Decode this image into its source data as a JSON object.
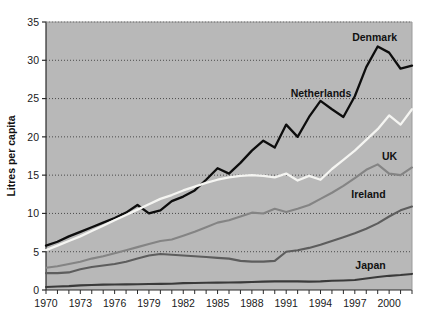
{
  "chart_data": {
    "type": "line",
    "title": "",
    "xlabel": "",
    "ylabel": "Litres per capita",
    "xlim": [
      1970,
      2002
    ],
    "ylim": [
      0,
      35
    ],
    "ytick_step": 5,
    "yticks": [
      0,
      5,
      10,
      15,
      20,
      25,
      30,
      35
    ],
    "ytick_labels": [
      "0",
      "5",
      "10",
      "15",
      "20",
      "25",
      "30",
      "35"
    ],
    "xticks": [
      1970,
      1973,
      1976,
      1979,
      1982,
      1985,
      1988,
      1991,
      1994,
      1997,
      2000
    ],
    "xtick_labels": [
      "1970",
      "1973",
      "1976",
      "1979",
      "1982",
      "1985",
      "1988",
      "1991",
      "1994",
      "1997",
      "2000"
    ],
    "x": [
      1970,
      1971,
      1972,
      1973,
      1974,
      1975,
      1976,
      1977,
      1978,
      1979,
      1980,
      1981,
      1982,
      1983,
      1984,
      1985,
      1986,
      1987,
      1988,
      1989,
      1990,
      1991,
      1992,
      1993,
      1994,
      1995,
      1996,
      1997,
      1998,
      1999,
      2000,
      2001,
      2002
    ],
    "grid": "horizontal-dotted",
    "legend_position": "inline-right-labels",
    "plot_background": "#b8b8b8",
    "series": [
      {
        "name": "Denmark",
        "color": "#0d0d0d",
        "width": 2.3,
        "label_anchor_year": 2000,
        "label_anchor_value": 33.0,
        "values": [
          5.8,
          6.3,
          7.0,
          7.6,
          8.2,
          8.8,
          9.4,
          10.1,
          11.1,
          10.0,
          10.4,
          11.6,
          12.2,
          13.0,
          14.4,
          15.9,
          15.2,
          16.6,
          18.2,
          19.5,
          18.6,
          21.6,
          20.0,
          22.6,
          24.7,
          23.6,
          22.6,
          25.3,
          29.1,
          31.8,
          31.0,
          28.9,
          29.3
        ]
      },
      {
        "name": "Netherlands",
        "color": "#f5f5f2",
        "width": 2.3,
        "label_anchor_year": 1996,
        "label_anchor_value": 25.6,
        "values": [
          5.2,
          5.8,
          6.4,
          7.0,
          7.7,
          8.4,
          9.1,
          9.8,
          10.5,
          11.2,
          11.9,
          12.4,
          13.0,
          13.5,
          14.0,
          14.4,
          14.7,
          14.9,
          15.0,
          14.9,
          14.7,
          15.2,
          14.3,
          14.9,
          14.4,
          15.8,
          17.0,
          18.2,
          19.6,
          21.0,
          22.8,
          21.6,
          23.6
        ]
      },
      {
        "name": "UK",
        "color": "#848484",
        "width": 2.1,
        "label_anchor_year": 2000,
        "label_anchor_value": 17.4,
        "values": [
          2.9,
          3.1,
          3.4,
          3.7,
          4.1,
          4.4,
          4.8,
          5.2,
          5.6,
          6.0,
          6.4,
          6.6,
          7.1,
          7.6,
          8.2,
          8.8,
          9.1,
          9.6,
          10.1,
          10.0,
          10.6,
          10.2,
          10.6,
          11.1,
          11.9,
          12.7,
          13.6,
          14.6,
          15.7,
          16.4,
          15.2,
          15.0,
          16.0
        ]
      },
      {
        "name": "Ireland",
        "color": "#5d5d5d",
        "width": 2.1,
        "label_anchor_year": 1999,
        "label_anchor_value": 12.5,
        "values": [
          2.2,
          2.2,
          2.3,
          2.7,
          3.0,
          3.2,
          3.4,
          3.7,
          4.1,
          4.5,
          4.7,
          4.6,
          4.5,
          4.4,
          4.3,
          4.2,
          4.1,
          3.8,
          3.7,
          3.7,
          3.8,
          5.0,
          5.2,
          5.5,
          5.9,
          6.4,
          6.9,
          7.4,
          8.0,
          8.7,
          9.6,
          10.4,
          10.9
        ]
      },
      {
        "name": "Japan",
        "color": "#3a3a3a",
        "width": 2.1,
        "label_anchor_year": 1999,
        "label_anchor_value": 3.2,
        "values": [
          0.4,
          0.45,
          0.5,
          0.6,
          0.65,
          0.7,
          0.72,
          0.74,
          0.76,
          0.78,
          0.8,
          0.82,
          0.9,
          0.92,
          0.94,
          0.96,
          0.98,
          1.0,
          1.05,
          1.1,
          1.12,
          1.15,
          1.12,
          1.1,
          1.12,
          1.2,
          1.25,
          1.3,
          1.5,
          1.7,
          1.85,
          1.95,
          2.1
        ]
      }
    ],
    "annotations": [
      {
        "text": "Denmark",
        "x": 2000,
        "y": 33.0
      },
      {
        "text": "Netherlands",
        "x": 1996,
        "y": 25.6
      },
      {
        "text": "UK",
        "x": 2000,
        "y": 17.4
      },
      {
        "text": "Ireland",
        "x": 1999,
        "y": 12.5
      },
      {
        "text": "Japan",
        "x": 1999,
        "y": 3.2
      }
    ]
  }
}
